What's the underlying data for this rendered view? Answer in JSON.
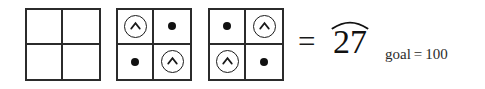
{
  "canvas": {
    "width": 485,
    "height": 89,
    "background": "#ffffff",
    "ink": "#1a1a1a"
  },
  "equation": {
    "operator_label": "=",
    "result_value": "27",
    "result_has_widehat": true,
    "goal_label": "goal",
    "goal_operator": "=",
    "goal_value": "100"
  },
  "grids": [
    {
      "index": 1,
      "name": "grid-empty",
      "cells": [
        {
          "position": "top-left",
          "symbol": "empty",
          "symbol_icon": "empty-cell-icon"
        },
        {
          "position": "top-right",
          "symbol": "empty",
          "symbol_icon": "empty-cell-icon"
        },
        {
          "position": "bottom-left",
          "symbol": "empty",
          "symbol_icon": "empty-cell-icon"
        },
        {
          "position": "bottom-right",
          "symbol": "empty",
          "symbol_icon": "empty-cell-icon"
        }
      ]
    },
    {
      "index": 2,
      "name": "grid-caret-dot-diagonal",
      "cells": [
        {
          "position": "top-left",
          "symbol": "circled-caret",
          "symbol_icon": "circled-caret-up-icon"
        },
        {
          "position": "top-right",
          "symbol": "dot",
          "symbol_icon": "filled-dot-icon"
        },
        {
          "position": "bottom-left",
          "symbol": "dot",
          "symbol_icon": "filled-dot-icon"
        },
        {
          "position": "bottom-right",
          "symbol": "circled-caret",
          "symbol_icon": "circled-caret-up-icon"
        }
      ]
    },
    {
      "index": 3,
      "name": "grid-dot-caret-antidiagonal",
      "cells": [
        {
          "position": "top-left",
          "symbol": "dot",
          "symbol_icon": "filled-dot-icon"
        },
        {
          "position": "top-right",
          "symbol": "circled-caret",
          "symbol_icon": "circled-caret-up-icon"
        },
        {
          "position": "bottom-left",
          "symbol": "circled-caret",
          "symbol_icon": "circled-caret-up-icon"
        },
        {
          "position": "bottom-right",
          "symbol": "dot",
          "symbol_icon": "filled-dot-icon"
        }
      ]
    }
  ]
}
